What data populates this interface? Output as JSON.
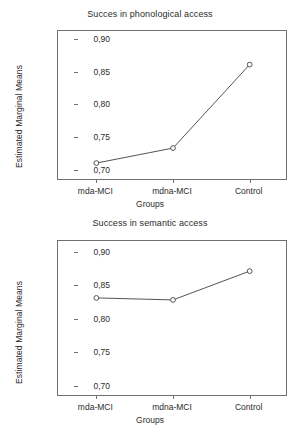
{
  "chart_data": [
    {
      "type": "line",
      "title": "Succes in phonological access",
      "xlabel": "Groups",
      "ylabel": "Estimated Marginal Means",
      "categories": [
        "mda-MCI",
        "mdna-MCI",
        "Control"
      ],
      "values": [
        0.71,
        0.733,
        0.861
      ],
      "yticks": [
        "0,70",
        "0,75",
        "0,80",
        "0,85",
        "0,90"
      ],
      "ytick_values": [
        0.7,
        0.75,
        0.8,
        0.85,
        0.9
      ],
      "ylim": [
        0.6825,
        0.9125
      ],
      "grid": false,
      "legend": "none",
      "marker": "open-circle",
      "line_color": "#555555"
    },
    {
      "type": "line",
      "title": "Success in semantic access",
      "xlabel": "Groups",
      "ylabel": "Estimated Marginal Means",
      "categories": [
        "mda-MCI",
        "mdna-MCI",
        "Control"
      ],
      "values": [
        0.831,
        0.828,
        0.871
      ],
      "yticks": [
        "0,70",
        "0,75",
        "0,80",
        "0,85",
        "0,90"
      ],
      "ytick_values": [
        0.7,
        0.75,
        0.8,
        0.85,
        0.9
      ],
      "ylim": [
        0.683,
        0.916
      ],
      "grid": false,
      "legend": "none",
      "marker": "open-circle",
      "line_color": "#555555"
    }
  ]
}
